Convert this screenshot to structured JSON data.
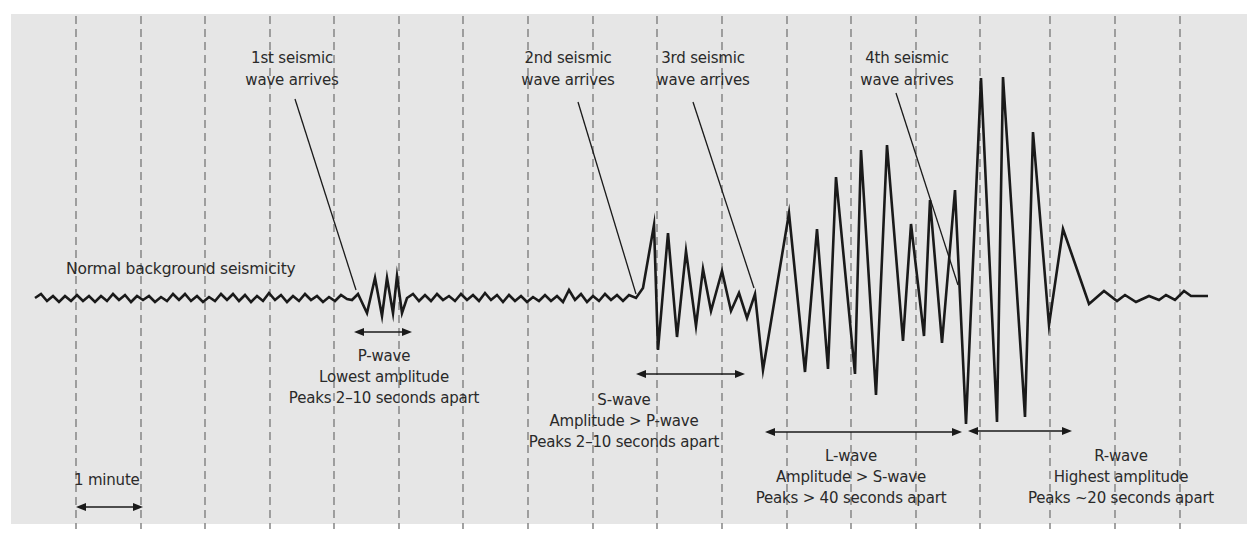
{
  "diagram": {
    "colors": {
      "background": "#e6e6e6",
      "page": "#ffffff",
      "trace": "#1a1a1a",
      "gridline": "#8c8c8c",
      "text": "#2a2a2a"
    },
    "gridlines_x": [
      76,
      141,
      205,
      270,
      334,
      399,
      463,
      528,
      593,
      657,
      722,
      787,
      851,
      916,
      980,
      1050,
      1115,
      1180
    ],
    "baseline_label": "Normal background seismicity",
    "scale": {
      "label": "1 minute",
      "x1": 78,
      "x2": 141
    },
    "arrivals": [
      {
        "id": "first",
        "line1": "1st seismic",
        "line2": "wave arrives",
        "cx": 292,
        "leader": [
          295,
          99,
          356,
          290
        ]
      },
      {
        "id": "second",
        "line1": "2nd seismic",
        "line2": "wave arrives",
        "cx": 568,
        "leader": [
          578,
          102,
          636,
          294
        ]
      },
      {
        "id": "third",
        "line1": "3rd seismic",
        "line2": "wave arrives",
        "cx": 703,
        "leader": [
          693,
          102,
          754,
          288
        ]
      },
      {
        "id": "fourth",
        "line1": "4th seismic",
        "line2": "wave arrives",
        "cx": 907,
        "leader": [
          896,
          93,
          958,
          285
        ]
      }
    ],
    "waves": [
      {
        "id": "p-wave",
        "name": "P-wave",
        "amplitude": "Lowest amplitude",
        "peaks": "Peaks 2–10 seconds apart",
        "arrow": [
          356,
          410,
          332
        ],
        "cx": 384,
        "ty": 346
      },
      {
        "id": "s-wave",
        "name": "S-wave",
        "amplitude": "Amplitude > P-wave",
        "peaks": "Peaks 2–10 seconds apart",
        "arrow": [
          638,
          743,
          374
        ],
        "cx": 624,
        "ty": 390
      },
      {
        "id": "l-wave",
        "name": "L-wave",
        "amplitude": "Amplitude > S-wave",
        "peaks": "Peaks > 40 seconds apart",
        "arrow": [
          767,
          960,
          432
        ],
        "cx": 851,
        "ty": 446
      },
      {
        "id": "r-wave",
        "name": "R-wave",
        "amplitude": "Highest amplitude",
        "peaks": "Peaks ~20 seconds apart",
        "arrow": [
          970,
          1070,
          431
        ],
        "cx": 1121,
        "ty": 446
      }
    ],
    "trace_points": [
      [
        35,
        298
      ],
      [
        41,
        294
      ],
      [
        47,
        301
      ],
      [
        53,
        296
      ],
      [
        59,
        302
      ],
      [
        65,
        296
      ],
      [
        71,
        301
      ],
      [
        77,
        295
      ],
      [
        83,
        301
      ],
      [
        89,
        296
      ],
      [
        95,
        302
      ],
      [
        101,
        296
      ],
      [
        107,
        301
      ],
      [
        113,
        294
      ],
      [
        119,
        300
      ],
      [
        125,
        295
      ],
      [
        131,
        302
      ],
      [
        137,
        296
      ],
      [
        143,
        300
      ],
      [
        149,
        296
      ],
      [
        155,
        302
      ],
      [
        161,
        297
      ],
      [
        167,
        301
      ],
      [
        173,
        294
      ],
      [
        179,
        300
      ],
      [
        185,
        294
      ],
      [
        191,
        301
      ],
      [
        197,
        296
      ],
      [
        203,
        302
      ],
      [
        209,
        297
      ],
      [
        215,
        301
      ],
      [
        221,
        294
      ],
      [
        227,
        300
      ],
      [
        233,
        294
      ],
      [
        239,
        301
      ],
      [
        245,
        295
      ],
      [
        251,
        302
      ],
      [
        257,
        296
      ],
      [
        263,
        301
      ],
      [
        269,
        293
      ],
      [
        275,
        300
      ],
      [
        281,
        295
      ],
      [
        287,
        302
      ],
      [
        293,
        296
      ],
      [
        299,
        301
      ],
      [
        305,
        294
      ],
      [
        311,
        300
      ],
      [
        317,
        296
      ],
      [
        323,
        302
      ],
      [
        329,
        297
      ],
      [
        335,
        301
      ],
      [
        341,
        295
      ],
      [
        347,
        299
      ],
      [
        352,
        300
      ],
      [
        358,
        294
      ],
      [
        367,
        313
      ],
      [
        375,
        278
      ],
      [
        382,
        316
      ],
      [
        387,
        278
      ],
      [
        393,
        313
      ],
      [
        397,
        276
      ],
      [
        402,
        313
      ],
      [
        407,
        298
      ],
      [
        413,
        294
      ],
      [
        419,
        301
      ],
      [
        425,
        295
      ],
      [
        431,
        301
      ],
      [
        437,
        294
      ],
      [
        443,
        300
      ],
      [
        449,
        296
      ],
      [
        455,
        301
      ],
      [
        461,
        294
      ],
      [
        467,
        300
      ],
      [
        473,
        295
      ],
      [
        479,
        301
      ],
      [
        485,
        293
      ],
      [
        491,
        300
      ],
      [
        497,
        295
      ],
      [
        503,
        302
      ],
      [
        509,
        295
      ],
      [
        515,
        301
      ],
      [
        521,
        296
      ],
      [
        527,
        302
      ],
      [
        533,
        297
      ],
      [
        539,
        301
      ],
      [
        545,
        295
      ],
      [
        551,
        301
      ],
      [
        557,
        296
      ],
      [
        563,
        302
      ],
      [
        569,
        290
      ],
      [
        575,
        300
      ],
      [
        581,
        294
      ],
      [
        587,
        302
      ],
      [
        593,
        296
      ],
      [
        599,
        301
      ],
      [
        605,
        294
      ],
      [
        611,
        300
      ],
      [
        617,
        295
      ],
      [
        623,
        301
      ],
      [
        629,
        295
      ],
      [
        636,
        298
      ],
      [
        643,
        288
      ],
      [
        654,
        225
      ],
      [
        658,
        350
      ],
      [
        668,
        233
      ],
      [
        677,
        337
      ],
      [
        686,
        251
      ],
      [
        696,
        326
      ],
      [
        703,
        269
      ],
      [
        711,
        311
      ],
      [
        722,
        271
      ],
      [
        731,
        311
      ],
      [
        739,
        293
      ],
      [
        747,
        318
      ],
      [
        755,
        294
      ],
      [
        763,
        370
      ],
      [
        789,
        213
      ],
      [
        805,
        372
      ],
      [
        817,
        229
      ],
      [
        828,
        369
      ],
      [
        836,
        177
      ],
      [
        855,
        374
      ],
      [
        861,
        150
      ],
      [
        876,
        395
      ],
      [
        887,
        145
      ],
      [
        903,
        341
      ],
      [
        911,
        224
      ],
      [
        924,
        336
      ],
      [
        930,
        200
      ],
      [
        942,
        343
      ],
      [
        955,
        190
      ],
      [
        966,
        424
      ],
      [
        981,
        78
      ],
      [
        997,
        422
      ],
      [
        1003,
        77
      ],
      [
        1025,
        417
      ],
      [
        1033,
        132
      ],
      [
        1049,
        325
      ],
      [
        1063,
        229
      ],
      [
        1089,
        304
      ],
      [
        1104,
        291
      ],
      [
        1117,
        301
      ],
      [
        1125,
        295
      ],
      [
        1136,
        302
      ],
      [
        1149,
        296
      ],
      [
        1159,
        300
      ],
      [
        1166,
        295
      ],
      [
        1175,
        300
      ],
      [
        1184,
        291
      ],
      [
        1191,
        296
      ],
      [
        1208,
        296
      ]
    ]
  }
}
